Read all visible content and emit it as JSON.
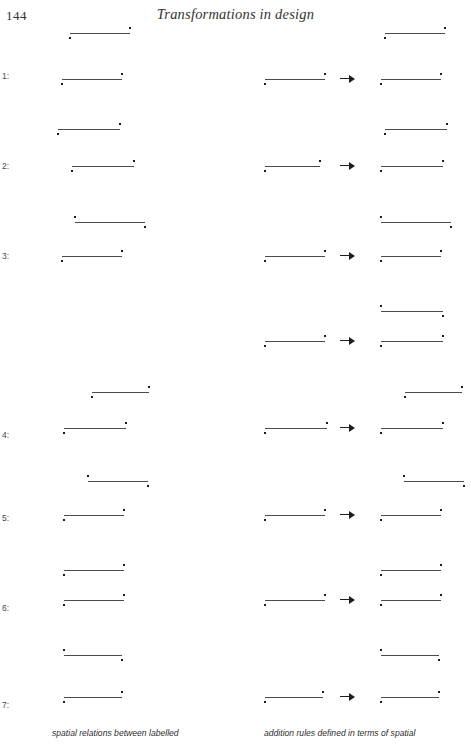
{
  "page": {
    "folio": "144",
    "running_head": "Transformations in design",
    "width": 471,
    "height": 746,
    "background": "#ffffff",
    "ink_color": "#4b4b4b",
    "dot_color": "#1d1d1d"
  },
  "captions": {
    "left": "spatial relations between labelled",
    "right": "addition rules defined in terms of spatial"
  },
  "columns": {
    "left_header": "spatial relations between labelled",
    "right_header": "addition rules defined in terms of spatial"
  },
  "row_labels": [
    "1:",
    "2:",
    "3:",
    "4:",
    "5:",
    "6:",
    "7:"
  ],
  "arrow_glyph": "right-arrow",
  "chart_data": {
    "type": "diagram",
    "title": "Transformations in design",
    "primitive": {
      "name": "labelled-line",
      "parts": [
        "horizontal line segment",
        "dot above one end",
        "dot below the other end"
      ],
      "orientations": {
        "A": "dot above right end, dot below left end",
        "B": "dot above left end, dot below right end"
      }
    },
    "rows": [
      {
        "label": "1:",
        "y": 62,
        "left": [
          {
            "x": 70,
            "w": 60,
            "y": 33,
            "orientation": "A"
          },
          {
            "x": 62,
            "w": 60,
            "y": 79,
            "orientation": "A"
          }
        ],
        "right": [
          {
            "x": 385,
            "w": 60,
            "y": 33,
            "orientation": "A"
          },
          {
            "x": 265,
            "w": 60,
            "y": 79,
            "orientation": "A"
          },
          {
            "x": 381,
            "w": 60,
            "y": 79,
            "orientation": "A"
          }
        ],
        "arrow": {
          "x": 340,
          "y": 74
        }
      },
      {
        "label": "2:",
        "y": 152,
        "left": [
          {
            "x": 58,
            "w": 62,
            "y": 129,
            "orientation": "A"
          },
          {
            "x": 72,
            "w": 62,
            "y": 166,
            "orientation": "A"
          }
        ],
        "right": [
          {
            "x": 385,
            "w": 62,
            "y": 129,
            "orientation": "A"
          },
          {
            "x": 265,
            "w": 55,
            "y": 166,
            "orientation": "A"
          },
          {
            "x": 381,
            "w": 62,
            "y": 166,
            "orientation": "A"
          }
        ],
        "arrow": {
          "x": 340,
          "y": 161
        }
      },
      {
        "label": "3:",
        "y": 242,
        "left": [
          {
            "x": 75,
            "w": 70,
            "y": 222,
            "orientation": "B"
          },
          {
            "x": 62,
            "w": 60,
            "y": 256,
            "orientation": "A"
          }
        ],
        "right": [
          {
            "x": 381,
            "w": 70,
            "y": 222,
            "orientation": "B"
          },
          {
            "x": 265,
            "w": 60,
            "y": 256,
            "orientation": "A"
          },
          {
            "x": 381,
            "w": 60,
            "y": 256,
            "orientation": "A"
          }
        ],
        "arrow": {
          "x": 340,
          "y": 251
        }
      },
      {
        "label": "",
        "y": 330,
        "left": [],
        "right": [
          {
            "x": 381,
            "w": 62,
            "y": 311,
            "orientation": "B"
          },
          {
            "x": 265,
            "w": 60,
            "y": 341,
            "orientation": "A"
          },
          {
            "x": 381,
            "w": 62,
            "y": 341,
            "orientation": "A"
          }
        ],
        "arrow": {
          "x": 340,
          "y": 336
        }
      },
      {
        "label": "4:",
        "y": 421,
        "left": [
          {
            "x": 92,
            "w": 57,
            "y": 392,
            "orientation": "A"
          },
          {
            "x": 64,
            "w": 62,
            "y": 428,
            "orientation": "A"
          }
        ],
        "right": [
          {
            "x": 405,
            "w": 57,
            "y": 392,
            "orientation": "A"
          },
          {
            "x": 265,
            "w": 62,
            "y": 428,
            "orientation": "A"
          },
          {
            "x": 381,
            "w": 62,
            "y": 428,
            "orientation": "A"
          }
        ],
        "arrow": {
          "x": 340,
          "y": 423
        }
      },
      {
        "label": "5:",
        "y": 504,
        "left": [
          {
            "x": 88,
            "w": 60,
            "y": 481,
            "orientation": "B"
          },
          {
            "x": 64,
            "w": 60,
            "y": 515,
            "orientation": "A"
          }
        ],
        "right": [
          {
            "x": 404,
            "w": 60,
            "y": 481,
            "orientation": "B"
          },
          {
            "x": 265,
            "w": 60,
            "y": 515,
            "orientation": "A"
          },
          {
            "x": 381,
            "w": 60,
            "y": 515,
            "orientation": "A"
          }
        ],
        "arrow": {
          "x": 340,
          "y": 510
        }
      },
      {
        "label": "6:",
        "y": 594,
        "left": [
          {
            "x": 64,
            "w": 60,
            "y": 570,
            "orientation": "A"
          },
          {
            "x": 64,
            "w": 60,
            "y": 600,
            "orientation": "A"
          }
        ],
        "right": [
          {
            "x": 381,
            "w": 60,
            "y": 570,
            "orientation": "A"
          },
          {
            "x": 265,
            "w": 60,
            "y": 600,
            "orientation": "A"
          },
          {
            "x": 381,
            "w": 60,
            "y": 600,
            "orientation": "A"
          }
        ],
        "arrow": {
          "x": 340,
          "y": 595
        }
      },
      {
        "label": "7:",
        "y": 691,
        "left": [
          {
            "x": 64,
            "w": 58,
            "y": 655,
            "orientation": "B"
          },
          {
            "x": 64,
            "w": 58,
            "y": 697,
            "orientation": "A"
          }
        ],
        "right": [
          {
            "x": 381,
            "w": 58,
            "y": 655,
            "orientation": "B"
          },
          {
            "x": 265,
            "w": 58,
            "y": 697,
            "orientation": "A"
          },
          {
            "x": 381,
            "w": 58,
            "y": 697,
            "orientation": "A"
          }
        ],
        "arrow": {
          "x": 340,
          "y": 692
        }
      }
    ]
  }
}
